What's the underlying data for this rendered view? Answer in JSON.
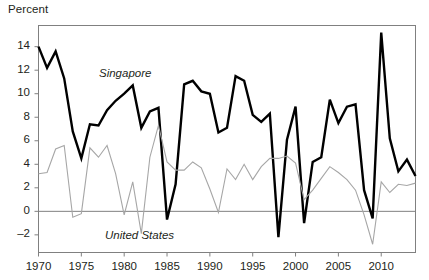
{
  "axis_title": "Percent",
  "labels": {
    "singapore": "Singapore",
    "united_states": "United States"
  },
  "colors": {
    "singapore_line": "#000000",
    "united_states_line": "#a6a6a6",
    "axis": "#808080",
    "text": "#231f20",
    "background": "#ffffff"
  },
  "chart_data": {
    "type": "line",
    "title": "",
    "subtitle": "",
    "xlabel": "",
    "ylabel": "Percent",
    "xlim": [
      1970,
      2014
    ],
    "ylim": [
      -3.5,
      15.8
    ],
    "yticks": [
      -2,
      0,
      2,
      4,
      6,
      8,
      10,
      12,
      14
    ],
    "ytick_labels": [
      "–2",
      "0",
      "2",
      "4",
      "6",
      "8",
      "10",
      "12",
      "14"
    ],
    "xticks": [
      1970,
      1975,
      1980,
      1985,
      1990,
      1995,
      2000,
      2005,
      2010
    ],
    "xtick_labels": [
      "1970",
      "1975",
      "1980",
      "1985",
      "1990",
      "1995",
      "2000",
      "2005",
      "2010"
    ],
    "grid": false,
    "zero_line": true,
    "legend": "inline-annotations",
    "x": [
      1970,
      1971,
      1972,
      1973,
      1974,
      1975,
      1976,
      1977,
      1978,
      1979,
      1980,
      1981,
      1982,
      1983,
      1984,
      1985,
      1986,
      1987,
      1988,
      1989,
      1990,
      1991,
      1992,
      1993,
      1994,
      1995,
      1996,
      1997,
      1998,
      1999,
      2000,
      2001,
      2002,
      2003,
      2004,
      2005,
      2006,
      2007,
      2008,
      2009,
      2010,
      2011,
      2012,
      2013
    ],
    "series": [
      {
        "name": "Singapore",
        "color": "#000000",
        "width": 2.4,
        "values": [
          14.0,
          12.2,
          13.6,
          11.3,
          6.8,
          4.5,
          7.4,
          7.3,
          8.6,
          9.4,
          10.0,
          10.7,
          7.1,
          8.5,
          8.8,
          -0.7,
          2.3,
          10.8,
          11.1,
          10.2,
          10.0,
          6.7,
          7.1,
          11.5,
          11.1,
          8.2,
          7.6,
          8.3,
          -2.2,
          6.1,
          8.9,
          -1.0,
          4.2,
          4.6,
          9.5,
          7.5,
          8.9,
          9.1,
          1.8,
          -0.6,
          15.2,
          6.2,
          3.4,
          4.4
        ],
        "last_value": 3.0
      },
      {
        "name": "United States",
        "color": "#a6a6a6",
        "width": 1.1,
        "values": [
          3.2,
          3.3,
          5.3,
          5.6,
          -0.5,
          -0.2,
          5.4,
          4.6,
          5.6,
          3.2,
          -0.3,
          2.5,
          -1.9,
          4.6,
          7.3,
          4.2,
          3.5,
          3.5,
          4.2,
          3.7,
          1.9,
          -0.1,
          3.6,
          2.7,
          4.0,
          2.7,
          3.8,
          4.5,
          4.5,
          4.7,
          4.1,
          1.0,
          1.8,
          2.8,
          3.8,
          3.3,
          2.7,
          1.8,
          -0.3,
          -2.8,
          2.5,
          1.6,
          2.3,
          2.2
        ],
        "last_value": 2.4
      }
    ]
  }
}
